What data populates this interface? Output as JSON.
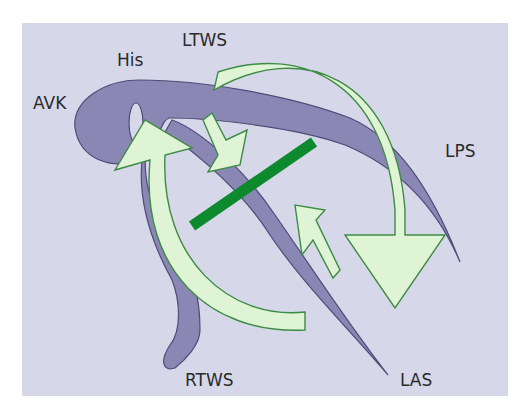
{
  "figure": {
    "background_color": "#d6d8ea",
    "conduction_color": "#8a87b4",
    "conduction_stroke": "#4e4b78",
    "arrow_fill": "#def4d4",
    "arrow_stroke": "#3d8a45",
    "block_line_color": "#0e8a2e"
  },
  "labels": {
    "avk": "AVK",
    "his": "His",
    "ltws": "LTWS",
    "lps": "LPS",
    "rtws": "RTWS",
    "las": "LAS"
  }
}
